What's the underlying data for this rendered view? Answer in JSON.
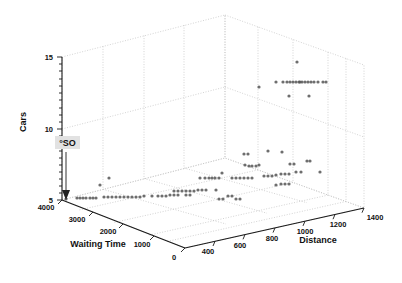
{
  "chart_data": {
    "type": "scatter",
    "projection": "3d",
    "title": "",
    "xlabel": "Waiting Time",
    "ylabel": "Distance",
    "zlabel": "Cars",
    "x_axis": {
      "label": "Waiting Time",
      "ticks": [
        4000,
        3000,
        2000,
        1000,
        0
      ],
      "tick_labels": [
        "4000",
        "3000",
        "2000",
        "1000",
        "0"
      ],
      "range": [
        0,
        4000
      ],
      "direction": "descending-left-to-right"
    },
    "y_axis": {
      "label": "Distance",
      "ticks": [
        400,
        600,
        800,
        1000,
        1200,
        1400
      ],
      "tick_labels": [
        "400",
        "600",
        "800",
        "1000",
        "1200",
        "1400"
      ],
      "range": [
        300,
        1500
      ]
    },
    "z_axis": {
      "label": "Cars",
      "ticks": [
        5,
        10,
        15
      ],
      "tick_labels": [
        "5",
        "10",
        "15"
      ],
      "minor_ticks": [
        5.5,
        6,
        6.5,
        7,
        7.5,
        8,
        8.5,
        9,
        9.5,
        10.5,
        11,
        11.5,
        12,
        12.5,
        13,
        13.5,
        14,
        14.5
      ],
      "range": [
        5,
        15
      ]
    },
    "grid": true,
    "legend": null,
    "marker": {
      "shape": "circle",
      "color": "#555555",
      "size_px": 3.2,
      "opacity": 0.85
    },
    "annotations": [
      {
        "text": "°SO",
        "label_x_px": 68,
        "label_y_px": 144,
        "arrow_to_x_px": 66,
        "arrow_to_y_px": 199,
        "background": "#e0e0e0",
        "arrow_color": "#333333"
      }
    ],
    "series": [
      {
        "name": "observations",
        "points_px": [
          [
            297,
            62
          ],
          [
            276,
            82
          ],
          [
            283,
            82
          ],
          [
            287,
            82
          ],
          [
            290,
            82
          ],
          [
            293,
            82
          ],
          [
            296,
            82
          ],
          [
            299,
            82
          ],
          [
            300,
            82
          ],
          [
            302,
            82
          ],
          [
            305,
            82
          ],
          [
            308,
            82
          ],
          [
            311,
            82
          ],
          [
            314,
            82
          ],
          [
            318,
            82
          ],
          [
            323,
            82
          ],
          [
            326,
            82
          ],
          [
            259,
            87
          ],
          [
            289,
            96
          ],
          [
            309,
            96
          ],
          [
            244,
            154
          ],
          [
            248,
            154
          ],
          [
            268,
            151
          ],
          [
            282,
            152
          ],
          [
            245,
            165
          ],
          [
            249,
            166
          ],
          [
            252,
            166
          ],
          [
            256,
            166
          ],
          [
            259,
            165
          ],
          [
            290,
            164
          ],
          [
            294,
            164
          ],
          [
            307,
            161
          ],
          [
            310,
            161
          ],
          [
            222,
            173
          ],
          [
            200,
            178
          ],
          [
            205,
            178
          ],
          [
            209,
            178
          ],
          [
            212,
            178
          ],
          [
            215,
            178
          ],
          [
            219,
            178
          ],
          [
            232,
            178
          ],
          [
            236,
            178
          ],
          [
            240,
            178
          ],
          [
            244,
            178
          ],
          [
            248,
            178
          ],
          [
            252,
            178
          ],
          [
            264,
            176
          ],
          [
            268,
            176
          ],
          [
            272,
            176
          ],
          [
            276,
            175
          ],
          [
            281,
            174
          ],
          [
            285,
            174
          ],
          [
            289,
            174
          ],
          [
            296,
            172
          ],
          [
            301,
            172
          ],
          [
            320,
            172
          ],
          [
            276,
            185
          ],
          [
            281,
            184
          ],
          [
            285,
            184
          ],
          [
            289,
            184
          ],
          [
            174,
            191
          ],
          [
            178,
            191
          ],
          [
            182,
            191
          ],
          [
            186,
            191
          ],
          [
            190,
            191
          ],
          [
            194,
            191
          ],
          [
            198,
            190
          ],
          [
            202,
            190
          ],
          [
            206,
            190
          ],
          [
            216,
            190
          ],
          [
            109,
            178
          ],
          [
            100,
            185
          ],
          [
            66,
            199
          ],
          [
            77,
            198
          ],
          [
            80,
            198
          ],
          [
            83,
            198
          ],
          [
            86,
            198
          ],
          [
            90,
            198
          ],
          [
            93,
            198
          ],
          [
            96,
            198
          ],
          [
            104,
            197
          ],
          [
            108,
            197
          ],
          [
            112,
            197
          ],
          [
            116,
            197
          ],
          [
            120,
            197
          ],
          [
            124,
            197
          ],
          [
            128,
            197
          ],
          [
            132,
            197
          ],
          [
            136,
            197
          ],
          [
            140,
            197
          ],
          [
            144,
            196
          ],
          [
            152,
            196
          ],
          [
            158,
            196
          ],
          [
            162,
            196
          ],
          [
            166,
            196
          ],
          [
            170,
            195
          ],
          [
            174,
            195
          ],
          [
            178,
            195
          ],
          [
            186,
            195
          ],
          [
            190,
            195
          ],
          [
            219,
            199
          ],
          [
            223,
            199
          ],
          [
            236,
            199
          ],
          [
            240,
            199
          ],
          [
            228,
            196
          ],
          [
            232,
            196
          ]
        ],
        "n_points": 96,
        "color": "#555555"
      }
    ]
  },
  "figure": {
    "background": "#ffffff",
    "box_color": "#bbbbbb",
    "axis_line_color": "#222222",
    "grid_style": "dotted"
  }
}
